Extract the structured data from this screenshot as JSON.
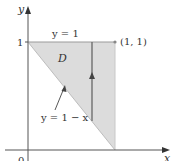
{
  "diagram": {
    "type": "region-of-integration",
    "axes": {
      "x_label": "x",
      "y_label": "y",
      "origin_label": "0",
      "y_tick_label": "1"
    },
    "region": {
      "label": "D",
      "vertices": [
        [
          0,
          1
        ],
        [
          1,
          1
        ],
        [
          1,
          0
        ]
      ],
      "fill": "#dcdcdc"
    },
    "curves": {
      "top_label": "y = 1",
      "hyp_label": "y = 1 − x"
    },
    "point": {
      "label": "(1, 1)"
    },
    "colors": {
      "axis": "#555555",
      "region": "#dcdcdc",
      "vertical_line": "#666666",
      "text": "#333333"
    }
  }
}
